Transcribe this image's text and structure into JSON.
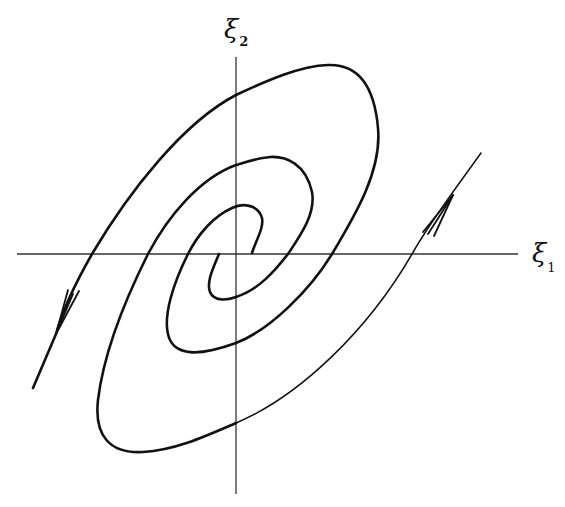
{
  "figure": {
    "type": "phase-portrait",
    "axes": {
      "x_label": {
        "symbol": "ξ",
        "subscript": "1"
      },
      "y_label": {
        "symbol": "ξ",
        "subscript": "2"
      },
      "origin_px": [
        236,
        254
      ]
    },
    "colors": {
      "line": "#111111",
      "axis": "#333333",
      "background": "#ffffff"
    },
    "arrows": [
      {
        "name": "outgoing-arrow-lower-left",
        "direction": "down-left"
      },
      {
        "name": "incoming-arrow-upper-right",
        "direction": "up-right"
      }
    ]
  }
}
